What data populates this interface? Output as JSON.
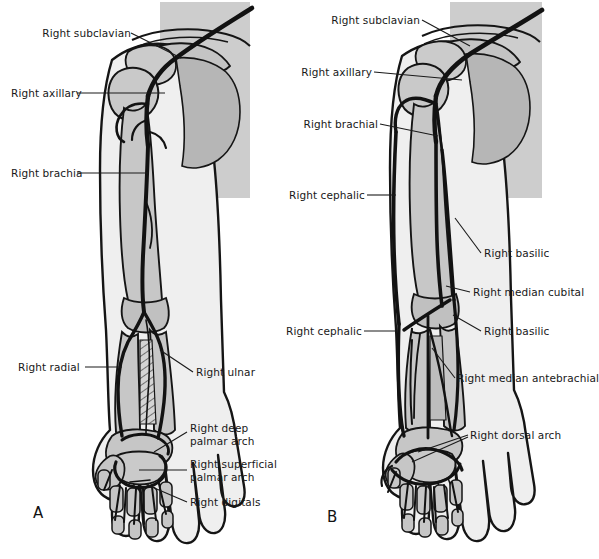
{
  "figure": {
    "background_color": "#ffffff",
    "ink_color": "#1a1a1a",
    "skin_fill": "#f0f0f0",
    "bone_fill": "#c8c8c8",
    "muscle_fill": "#b4b4b4",
    "vessel_color": "#141414"
  },
  "panels": [
    {
      "id": "A",
      "letter": "A",
      "subject": "right upper limb arteries",
      "labels": [
        {
          "id": "a-subclavian",
          "text": "Right subclavian",
          "side": "left",
          "x": 42,
          "y": 27,
          "lines": 1
        },
        {
          "id": "a-axillary",
          "text": "Right axillary",
          "side": "left",
          "x": 11,
          "y": 87,
          "lines": 1
        },
        {
          "id": "a-brachial",
          "text": "Right brachia",
          "side": "left",
          "x": 11,
          "y": 167,
          "lines": 1
        },
        {
          "id": "a-radial",
          "text": "Right radial",
          "side": "left",
          "x": 33,
          "y": 361,
          "lines": 1
        },
        {
          "id": "a-ulnar",
          "text": "Right ulnar",
          "side": "right",
          "x": 196,
          "y": 366,
          "lines": 1
        },
        {
          "id": "a-deep-palmar",
          "text": "Right deep\npalmar arch",
          "side": "right",
          "x": 190,
          "y": 422,
          "lines": 2
        },
        {
          "id": "a-sup-palmar",
          "text": "Right superficial\npalmar arch",
          "side": "right",
          "x": 190,
          "y": 458,
          "lines": 2
        },
        {
          "id": "a-digitals",
          "text": "Right digitals",
          "side": "right",
          "x": 190,
          "y": 496,
          "lines": 1
        }
      ]
    },
    {
      "id": "B",
      "letter": "B",
      "subject": "right upper limb veins",
      "labels": [
        {
          "id": "b-subclavian",
          "text": "Right subclavian",
          "side": "left",
          "x": 334,
          "y": 14,
          "lines": 1
        },
        {
          "id": "b-axillary",
          "text": "Right axillary",
          "side": "left",
          "x": 307,
          "y": 66,
          "lines": 1
        },
        {
          "id": "b-brachial",
          "text": "Right brachial",
          "side": "left",
          "x": 313,
          "y": 118,
          "lines": 1
        },
        {
          "id": "b-cephalic-upper",
          "text": "Right cephalic",
          "side": "left",
          "x": 300,
          "y": 189,
          "lines": 1
        },
        {
          "id": "b-basilic-upper",
          "text": "Right basilic",
          "side": "right",
          "x": 484,
          "y": 247,
          "lines": 1
        },
        {
          "id": "b-median-cubital",
          "text": "Right median cubital",
          "side": "right",
          "x": 473,
          "y": 286,
          "lines": 1
        },
        {
          "id": "b-cephalic-lower",
          "text": "Right cephalic",
          "side": "left",
          "x": 297,
          "y": 325,
          "lines": 1
        },
        {
          "id": "b-basilic-lower",
          "text": "Right basilic",
          "side": "right",
          "x": 484,
          "y": 325,
          "lines": 1
        },
        {
          "id": "b-median-ante",
          "text": "Right median antebrachial",
          "side": "right",
          "x": 457,
          "y": 372,
          "lines": 1
        },
        {
          "id": "b-dorsal-arch",
          "text": "Right dorsal arch",
          "side": "right",
          "x": 470,
          "y": 429,
          "lines": 1
        }
      ]
    }
  ],
  "panel_letters": [
    {
      "id": "letter-a",
      "text": "A",
      "x": 33,
      "y": 504
    },
    {
      "id": "letter-b",
      "text": "B",
      "x": 327,
      "y": 508
    }
  ]
}
